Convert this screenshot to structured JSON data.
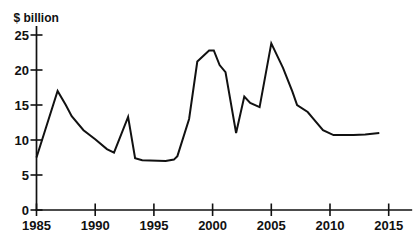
{
  "chart_data": {
    "type": "line",
    "title": "",
    "ylabel": "$ billion",
    "xlabel": "",
    "x_tick_labels": [
      "1985",
      "1990",
      "1995",
      "2000",
      "2005",
      "2010",
      "2015"
    ],
    "x_tick_values": [
      1985,
      1990,
      1995,
      2000,
      2005,
      2010,
      2015
    ],
    "y_tick_labels": [
      "0",
      "5",
      "10",
      "15",
      "20",
      "25"
    ],
    "y_tick_values": [
      0,
      5,
      10,
      15,
      20,
      25
    ],
    "xlim": [
      1985,
      2017
    ],
    "ylim": [
      0,
      25
    ],
    "grid": false,
    "legend": "none",
    "line_color": "#111111",
    "axis_color": "#111111",
    "series": [
      {
        "name": "$ billion",
        "points": [
          [
            1985,
            7.5
          ],
          [
            1986.8,
            17
          ],
          [
            1987.5,
            15
          ],
          [
            1988,
            13.4
          ],
          [
            1989,
            11.4
          ],
          [
            1990,
            10.1
          ],
          [
            1991,
            8.7
          ],
          [
            1991.6,
            8.2
          ],
          [
            1992.8,
            13.3
          ],
          [
            1993.4,
            7.4
          ],
          [
            1994,
            7.1
          ],
          [
            1996,
            7
          ],
          [
            1996.7,
            7.2
          ],
          [
            1997,
            7.7
          ],
          [
            1998,
            13
          ],
          [
            1998.7,
            21.2
          ],
          [
            1999.7,
            22.8
          ],
          [
            2000.1,
            22.8
          ],
          [
            2000.6,
            20.7
          ],
          [
            2001.1,
            19.7
          ],
          [
            2002,
            11
          ],
          [
            2002.7,
            16.2
          ],
          [
            2003.2,
            15.3
          ],
          [
            2004,
            14.7
          ],
          [
            2005,
            23.8
          ],
          [
            2006,
            20.3
          ],
          [
            2006.8,
            16.9
          ],
          [
            2007.2,
            15
          ],
          [
            2008.1,
            14
          ],
          [
            2008.7,
            12.8
          ],
          [
            2009.4,
            11.4
          ],
          [
            2010.3,
            10.7
          ],
          [
            2012,
            10.7
          ],
          [
            2013,
            10.8
          ],
          [
            2014.2,
            11
          ]
        ]
      }
    ]
  }
}
